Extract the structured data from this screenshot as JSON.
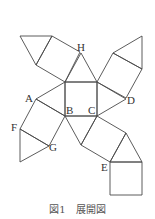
{
  "diagram": {
    "caption": "図1　展開図",
    "labels": {
      "A": "A",
      "B": "B",
      "C": "C",
      "D": "D",
      "E": "E",
      "F": "F",
      "G": "G",
      "H": "H"
    },
    "stroke_color": "#4a4a4a",
    "faces": [
      {
        "type": "square",
        "name": "center-square",
        "points": [
          [
            65,
            82
          ],
          [
            97,
            82
          ],
          [
            97,
            116
          ],
          [
            65,
            116
          ]
        ]
      },
      {
        "type": "triangle",
        "name": "H-triangle",
        "points": [
          [
            65,
            82
          ],
          [
            81,
            53
          ],
          [
            97,
            82
          ]
        ]
      },
      {
        "type": "square",
        "name": "upper-left-square",
        "points": [
          [
            65,
            82
          ],
          [
            80,
            52
          ],
          [
            52,
            36
          ],
          [
            36,
            65
          ]
        ]
      },
      {
        "type": "triangle",
        "name": "top-left-triangle",
        "points": [
          [
            20,
            36
          ],
          [
            52,
            36
          ],
          [
            36,
            65
          ]
        ]
      },
      {
        "type": "square",
        "name": "upper-right-square",
        "points": [
          [
            97,
            82
          ],
          [
            113,
            53
          ],
          [
            142,
            69
          ],
          [
            126,
            98
          ]
        ]
      },
      {
        "type": "triangle",
        "name": "top-right-triangle",
        "points": [
          [
            113,
            53
          ],
          [
            142,
            36
          ],
          [
            142,
            69
          ]
        ]
      },
      {
        "type": "triangle",
        "name": "A-triangle",
        "points": [
          [
            65,
            82
          ],
          [
            36,
            99
          ],
          [
            65,
            116
          ]
        ]
      },
      {
        "type": "triangle",
        "name": "D-triangle",
        "points": [
          [
            97,
            82
          ],
          [
            126,
            99
          ],
          [
            97,
            116
          ]
        ]
      },
      {
        "type": "square",
        "name": "left-square",
        "points": [
          [
            36,
            99
          ],
          [
            65,
            116
          ],
          [
            49,
            146
          ],
          [
            20,
            129
          ]
        ]
      },
      {
        "type": "triangle",
        "name": "F-G-triangle",
        "points": [
          [
            20,
            129
          ],
          [
            49,
            146
          ],
          [
            20,
            162
          ]
        ]
      },
      {
        "type": "triangle",
        "name": "B-C-lower-triangle",
        "points": [
          [
            65,
            116
          ],
          [
            97,
            116
          ],
          [
            81,
            145
          ]
        ]
      },
      {
        "type": "square",
        "name": "lower-right-square",
        "points": [
          [
            97,
            116
          ],
          [
            126,
            133
          ],
          [
            110,
            162
          ],
          [
            81,
            145
          ]
        ]
      },
      {
        "type": "triangle",
        "name": "E-triangle",
        "points": [
          [
            126,
            133
          ],
          [
            142,
            162
          ],
          [
            110,
            162
          ]
        ]
      },
      {
        "type": "square",
        "name": "bottom-square",
        "points": [
          [
            110,
            162
          ],
          [
            142,
            162
          ],
          [
            142,
            195
          ],
          [
            110,
            195
          ]
        ]
      }
    ]
  }
}
